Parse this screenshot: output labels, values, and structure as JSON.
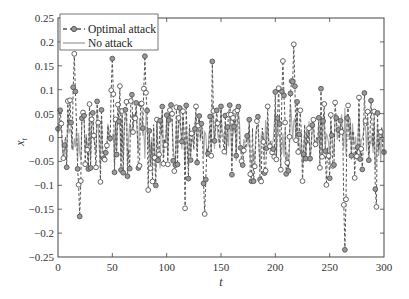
{
  "chart_data": {
    "type": "line",
    "title": "",
    "xlabel": "t",
    "ylabel": "x_t",
    "xlim": [
      0,
      300
    ],
    "ylim": [
      -0.25,
      0.25
    ],
    "xticks": [
      0,
      50,
      100,
      150,
      200,
      250,
      300
    ],
    "xtick_labels": [
      "0",
      "50",
      "100",
      "150",
      "200",
      "250",
      "300"
    ],
    "yticks": [
      -0.25,
      -0.2,
      -0.15,
      -0.1,
      -0.05,
      0,
      0.05,
      0.1,
      0.15,
      0.2,
      0.25
    ],
    "ytick_labels": [
      "-0.25",
      "-0.2",
      "-0.15",
      "-0.1",
      "-0.05",
      "0",
      "0.05",
      "0.1",
      "0.15",
      "0.2",
      "0.25"
    ],
    "grid": false,
    "legend_position": "upper left",
    "series": [
      {
        "name": "Optimal attack",
        "style": "dashed line with circle markers",
        "color": "#555555",
        "marker_fill": "#9a9a9a",
        "approx_extremes": [
          {
            "t": 15,
            "value": 0.175
          },
          {
            "t": 20,
            "value": -0.165
          },
          {
            "t": 50,
            "value": 0.165
          },
          {
            "t": 80,
            "value": 0.17
          },
          {
            "t": 135,
            "value": -0.16
          },
          {
            "t": 207,
            "value": 0.16
          },
          {
            "t": 217,
            "value": 0.195
          },
          {
            "t": 264,
            "value": -0.235
          }
        ]
      },
      {
        "name": "No attack",
        "style": "solid line",
        "color": "#a8a8a8",
        "approx_range": [
          -0.08,
          0.07
        ]
      }
    ],
    "n_points": 300
  },
  "legend": {
    "items": [
      {
        "label": "Optimal attack"
      },
      {
        "label": "No attack"
      }
    ]
  },
  "axes": {
    "x_label": "t",
    "y_label_main": "x",
    "y_label_sub": "t"
  }
}
